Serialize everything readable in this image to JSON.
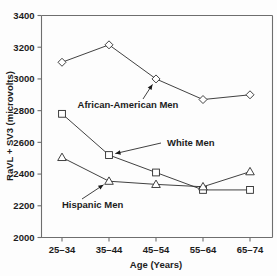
{
  "chart_data": {
    "type": "line",
    "title": "",
    "xlabel": "Age (Years)",
    "ylabel": "RaVL + SV3 (microvolts)",
    "categories": [
      "25–34",
      "35–44",
      "45–54",
      "55–64",
      "65–74"
    ],
    "ylim": [
      2000,
      3400
    ],
    "yticks": [
      2000,
      2200,
      2400,
      2600,
      2800,
      3000,
      3200,
      3400
    ],
    "ytick_labels": [
      "2000",
      "2200",
      "2400",
      "2600",
      "2800",
      "3000",
      "3200",
      "3400"
    ],
    "grid": false,
    "legend": "annotations-inline",
    "series": [
      {
        "name": "African-American Men",
        "marker": "diamond",
        "values": [
          3105,
          3215,
          3000,
          2870,
          2900
        ]
      },
      {
        "name": "White Men",
        "marker": "square",
        "values": [
          2780,
          2520,
          2410,
          2300,
          2300
        ]
      },
      {
        "name": "Hispanic Men",
        "marker": "triangle",
        "values": [
          2505,
          2355,
          2335,
          2320,
          2415
        ]
      }
    ],
    "annotations": [
      {
        "text": "African-American Men",
        "target_series": "African-American Men",
        "target_category": "45–54"
      },
      {
        "text": "White Men",
        "target_series": "White Men",
        "target_category": "35–44"
      },
      {
        "text": "Hispanic Men",
        "target_series": "Hispanic Men",
        "target_category": "35–44"
      }
    ],
    "colors": {
      "line": "#2b2b2b",
      "axis": "#6e6e6e",
      "marker_fill": "#ffffff",
      "text": "#1a1a1a",
      "background": "#fdfdfd"
    }
  }
}
